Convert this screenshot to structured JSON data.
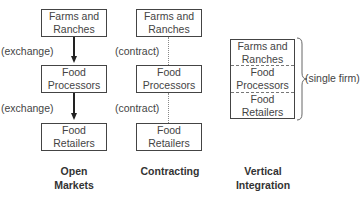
{
  "columns": [
    {
      "title_line1": "Open",
      "title_line2": "Markets",
      "boxes": [
        {
          "line1": "Farms and",
          "line2": "Ranches"
        },
        {
          "line1": "Food",
          "line2": "Processors"
        },
        {
          "line1": "Food",
          "line2": "Retailers"
        }
      ],
      "links": [
        {
          "label": "(exchange)",
          "style": "arrow"
        },
        {
          "label": "(exchange)",
          "style": "arrow"
        }
      ]
    },
    {
      "title_line1": "Contracting",
      "title_line2": "",
      "boxes": [
        {
          "line1": "Farms and",
          "line2": "Ranches"
        },
        {
          "line1": "Food",
          "line2": "Processors"
        },
        {
          "line1": "Food",
          "line2": "Retailers"
        }
      ],
      "links": [
        {
          "label": "(contract)",
          "style": "dotted"
        },
        {
          "label": "(contract)",
          "style": "dotted"
        }
      ]
    },
    {
      "title_line1": "Vertical",
      "title_line2": "Integration",
      "cells": [
        {
          "line1": "Farms and",
          "line2": "Ranches"
        },
        {
          "line1": "Food",
          "line2": "Processors"
        },
        {
          "line1": "Food",
          "line2": "Retailers"
        }
      ],
      "brace_label": "(single firm)"
    }
  ]
}
